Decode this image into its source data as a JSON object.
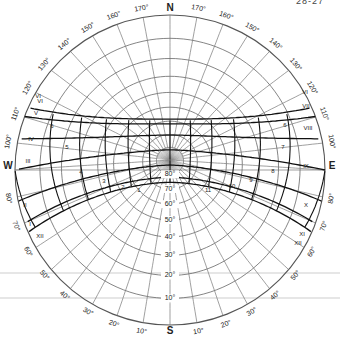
{
  "header": {
    "left_fragment": "",
    "right_fragment": "28-27"
  },
  "chart_data": {
    "type": "sun-path-diagram",
    "title": "",
    "projection": "stereographic",
    "cardinals": {
      "N": "N",
      "S": "S",
      "E": "E",
      "W": "W"
    },
    "azimuth_labels": {
      "north_side": [
        "170°",
        "160°",
        "150°",
        "140°",
        "130°",
        "120°",
        "110°",
        "100°"
      ],
      "south_side": [
        "80°",
        "70°",
        "60°",
        "50°",
        "40°",
        "30°",
        "20°",
        "10°"
      ],
      "azimuth_step_deg": 10
    },
    "altitude_labels": [
      "10°",
      "20°",
      "30°",
      "40°",
      "50°",
      "60°",
      "70°",
      "80°"
    ],
    "altitude_step_deg": 10,
    "month_labels": {
      "west": [
        "I",
        "II",
        "III",
        "IV",
        "V",
        "VI",
        "VI",
        "XII"
      ],
      "east": [
        "VI",
        "VII",
        "VIII",
        "IX",
        "X",
        "XI",
        "XII"
      ]
    },
    "hour_labels": {
      "morning_side": [
        "12",
        "1",
        "2",
        "3",
        "4",
        "5",
        "6"
      ],
      "afternoon_side": [
        "12",
        "11",
        "10",
        "9",
        "8",
        "7",
        "6"
      ]
    },
    "sun_paths": [
      {
        "label": "June (VI)",
        "declination": 23.45
      },
      {
        "label": "May/July (V/VII)",
        "declination": 20
      },
      {
        "label": "Apr/Aug (IV/VIII)",
        "declination": 11.5
      },
      {
        "label": "Mar/Sep (III/IX)",
        "declination": 0
      },
      {
        "label": "Feb/Oct (II/X)",
        "declination": -11.5
      },
      {
        "label": "Jan/Nov (I/XI)",
        "declination": -20
      },
      {
        "label": "Dec (XII)",
        "declination": -23.45
      }
    ],
    "latitude_deg": -8,
    "hours": [
      6,
      7,
      8,
      9,
      10,
      11,
      12,
      13,
      14,
      15,
      16,
      17,
      18
    ]
  }
}
